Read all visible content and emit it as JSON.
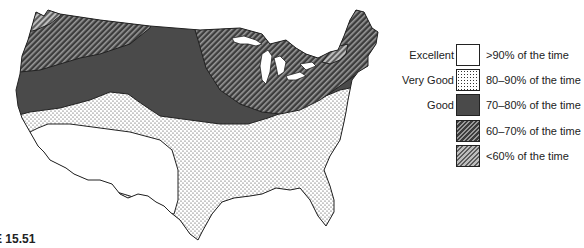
{
  "figure": {
    "label": "E 15.51"
  },
  "legend": {
    "items": [
      {
        "rating": "Excellent",
        "description": ">90% of the time",
        "pattern": "blank",
        "fill": "#ffffff"
      },
      {
        "rating": "Very Good",
        "description": "80–90% of the time",
        "pattern": "dots",
        "fill": "#f2f2f2"
      },
      {
        "rating": "Good",
        "description": "70–80% of the time",
        "pattern": "solid",
        "fill": "#4a4a4a"
      },
      {
        "rating": "",
        "description": "60–70% of the time",
        "pattern": "hatch-dark",
        "fill": "#3a3a3a"
      },
      {
        "rating": "",
        "description": "<60% of the time",
        "pattern": "hatch-light",
        "fill": "#7a7a7a"
      }
    ]
  },
  "map": {
    "regions": [
      {
        "name": "southwest",
        "category": "Excellent"
      },
      {
        "name": "south-band",
        "category": "Very Good"
      },
      {
        "name": "central",
        "category": "Good"
      },
      {
        "name": "northwest",
        "category": "60–70%"
      },
      {
        "name": "northeast",
        "category": "60–70%"
      },
      {
        "name": "nw-coast",
        "category": "<60%"
      },
      {
        "name": "new-england-patch",
        "category": "<60%"
      }
    ]
  }
}
